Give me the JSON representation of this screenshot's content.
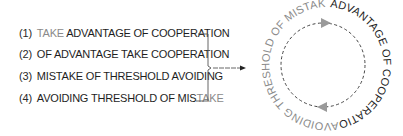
{
  "list": {
    "items": [
      {
        "number": "(1)",
        "parts": [
          {
            "text": "TAKE ",
            "tone": "gray"
          },
          {
            "text": "ADVANTAGE OF COOPERATION",
            "tone": "dark"
          }
        ]
      },
      {
        "number": "(2)",
        "parts": [
          {
            "text": "OF ADVANTAGE TAKE COOPERATION",
            "tone": "dark"
          }
        ]
      },
      {
        "number": "(3)",
        "parts": [
          {
            "text": "MISTAKE OF THRESHOLD AVOIDING",
            "tone": "dark"
          }
        ]
      },
      {
        "number": "(4)",
        "parts": [
          {
            "text": "AVOIDING THRESHOLD OF MIS",
            "tone": "dark"
          },
          {
            "text": "TAKE",
            "tone": "gray"
          }
        ]
      }
    ]
  },
  "cycle": {
    "dark_arc_text": "ADVANTAGE OF COOPERATION",
    "gray_arc_text": "AVOIDING THRESHOLD OF MISTAKE",
    "arrow_top_direction": "clockwise-right",
    "arrow_bottom_direction": "clockwise-left"
  },
  "colors": {
    "dark": "#1e1e1e",
    "gray": "#8a8a8a",
    "dashed_circle": "#444444",
    "arrowhead": "#9a9a9a",
    "bracket": "#555555"
  }
}
